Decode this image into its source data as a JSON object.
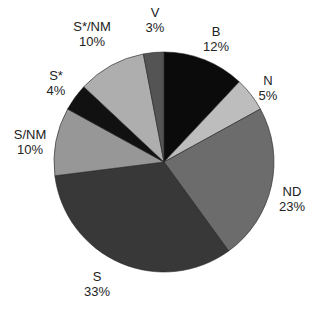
{
  "chart_data": {
    "type": "pie",
    "title": "",
    "center": [
      164,
      162
    ],
    "radius": 110,
    "start_angle_deg": -90,
    "direction": "clockwise",
    "slices": [
      {
        "label": "B",
        "value": 12,
        "pct_label": "12%",
        "color": "#0b0b0b",
        "label_pos": [
          216,
          24
        ]
      },
      {
        "label": "N",
        "value": 5,
        "pct_label": "5%",
        "color": "#bdbdbd",
        "label_pos": [
          268,
          73
        ]
      },
      {
        "label": "ND",
        "value": 23,
        "pct_label": "23%",
        "color": "#6c6c6c",
        "label_pos": [
          292,
          184
        ]
      },
      {
        "label": "S",
        "value": 33,
        "pct_label": "33%",
        "color": "#383838",
        "label_pos": [
          97,
          269
        ]
      },
      {
        "label": "S/NM",
        "value": 10,
        "pct_label": "10%",
        "color": "#979797",
        "label_pos": [
          30,
          127
        ]
      },
      {
        "label": "S*",
        "value": 4,
        "pct_label": "4%",
        "color": "#111111",
        "label_pos": [
          56,
          68
        ]
      },
      {
        "label": "S*/NM",
        "value": 10,
        "pct_label": "10%",
        "color": "#aeaeae",
        "label_pos": [
          92,
          19
        ]
      },
      {
        "label": "V",
        "value": 3,
        "pct_label": "3%",
        "color": "#545454",
        "label_pos": [
          155,
          5
        ]
      }
    ],
    "legend": "none"
  }
}
